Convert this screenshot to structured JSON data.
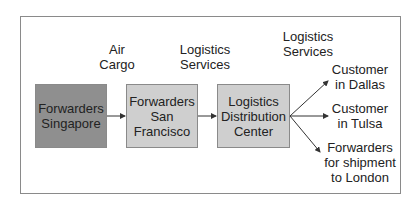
{
  "diagram": {
    "type": "flow",
    "nodes": [
      {
        "id": "singapore",
        "label": "Forwarders\nSingapore",
        "fill": "#8f8f8f"
      },
      {
        "id": "sanfrancisco",
        "label": "Forwarders\nSan\nFrancisco",
        "fill": "#cfcfcf"
      },
      {
        "id": "distribution",
        "label": "Logistics\nDistribution\nCenter",
        "fill": "#cfcfcf"
      }
    ],
    "edge_labels": [
      {
        "id": "air-cargo",
        "label": "Air\nCargo"
      },
      {
        "id": "logistics-services-1",
        "label": "Logistics\nServices"
      },
      {
        "id": "logistics-services-2",
        "label": "Logistics\nServices"
      }
    ],
    "destinations": [
      {
        "id": "dallas",
        "label": "Customer\nin Dallas"
      },
      {
        "id": "tulsa",
        "label": "Customer\nin Tulsa"
      },
      {
        "id": "london",
        "label": "Forwarders\nfor shipment\nto London"
      }
    ],
    "edges": [
      {
        "from": "singapore",
        "to": "sanfrancisco",
        "label": "Air Cargo"
      },
      {
        "from": "sanfrancisco",
        "to": "distribution",
        "label": "Logistics Services"
      },
      {
        "from": "distribution",
        "to": "dallas",
        "label": "Logistics Services"
      },
      {
        "from": "distribution",
        "to": "tulsa",
        "label": "Logistics Services"
      },
      {
        "from": "distribution",
        "to": "london",
        "label": "Logistics Services"
      }
    ]
  }
}
